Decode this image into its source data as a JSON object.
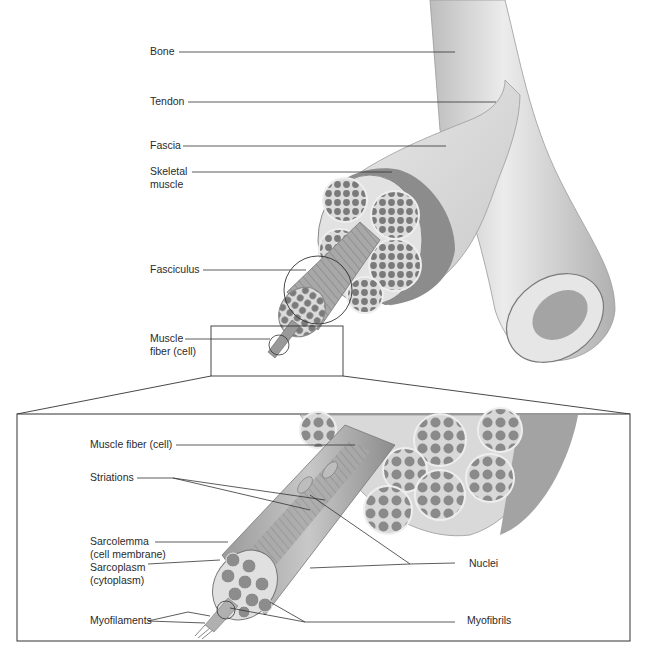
{
  "figure": {
    "colors": {
      "ink": "#2b2b2b",
      "muscle": "#8a8a8a",
      "muscle_dark": "#6e6e6e",
      "tissue_light": "#e4e4e4",
      "bone": "#d8d8d8",
      "leader": "#333333"
    }
  },
  "top_labels": {
    "bone": "Bone",
    "tendon": "Tendon",
    "fascia": "Fascia",
    "skeletal_muscle_line1": "Skeletal",
    "skeletal_muscle_line2": "muscle",
    "fasciculus": "Fasciculus",
    "muscle_fiber_line1": "Muscle",
    "muscle_fiber_line2": "fiber (cell)"
  },
  "inset_labels": {
    "muscle_fiber": "Muscle fiber (cell)",
    "striations": "Striations",
    "sarcolemma_line1": "Sarcolemma",
    "sarcolemma_line2": "(cell membrane)",
    "sarcoplasm_line1": "Sarcoplasm",
    "sarcoplasm_line2": "(cytoplasm)",
    "myofilaments": "Myofilaments",
    "nuclei": "Nuclei",
    "myofibrils": "Myofibrils"
  }
}
